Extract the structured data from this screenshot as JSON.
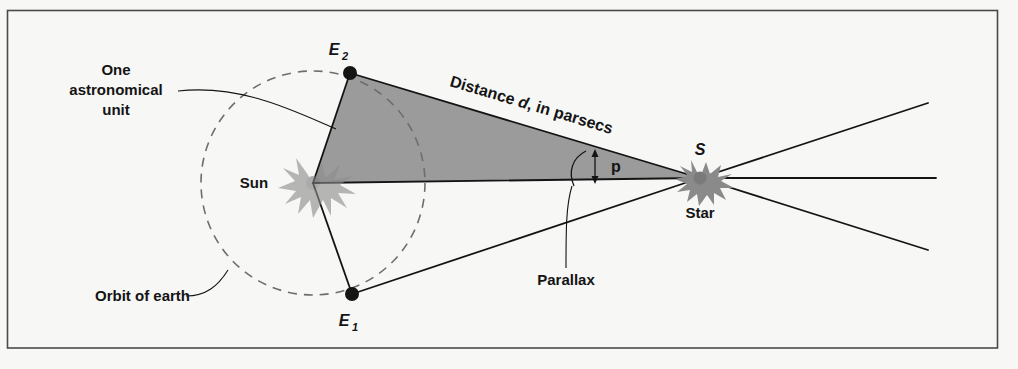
{
  "figure": {
    "background_color": "#f7f7f6",
    "frame_color": "#4a4a4a",
    "ink_color": "#141414",
    "triangle_fill": "#9b9b9b",
    "orbit_stroke": "#6e6e6e"
  },
  "labels": {
    "one_au_line1": "One",
    "one_au_line2": "astronomical",
    "one_au_line3": "unit",
    "orbit_of_earth": "Orbit of earth",
    "sun": "Sun",
    "star_symbol": "S",
    "star_word": "Star",
    "parallax": "Parallax",
    "angle_p": "p",
    "distance_prefix": "Distance ",
    "distance_var": "d",
    "distance_suffix": ", in parsecs",
    "e_letter": "E",
    "e1_sub": "1",
    "e2_sub": "2"
  },
  "geometry": {
    "sun_x": 313,
    "sun_y": 183,
    "star_x": 700,
    "star_y": 178,
    "e1_x": 352,
    "e1_y": 294,
    "e2_x": 350,
    "e2_y": 73,
    "orbit_radius": 112,
    "frame_left": 7,
    "frame_top": 10,
    "frame_right": 998,
    "frame_bottom": 348,
    "ray_upper_end_x": 928,
    "ray_upper_end_y": 103,
    "ray_middle_end_x": 936,
    "ray_middle_end_y": 178,
    "ray_lower_end_x": 928,
    "ray_lower_end_y": 250,
    "angle_marker_x": 595,
    "angle_marker_top_y": 152,
    "angle_marker_bottom_y": 180
  },
  "icons": {
    "sun_icon": "sun-burst-icon",
    "star_icon": "star-burst-icon",
    "e1_icon": "earth-position-dot-icon",
    "e2_icon": "earth-position-dot-icon"
  }
}
